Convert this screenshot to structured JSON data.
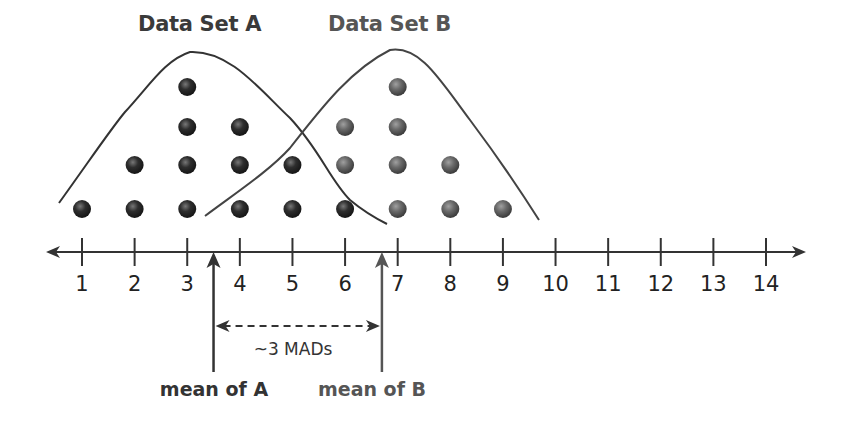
{
  "chart_data": {
    "type": "scatter",
    "subtype": "dot_plot",
    "titles": [
      "Data Set A",
      "Data Set B"
    ],
    "x_axis": {
      "min": 1,
      "max": 14,
      "ticks": [
        1,
        2,
        3,
        4,
        5,
        6,
        7,
        8,
        9,
        10,
        11,
        12,
        13,
        14
      ],
      "arrows_both_ends": true
    },
    "series": [
      {
        "name": "Data Set A",
        "color": "#2e2e2e",
        "counts": {
          "1": 1,
          "2": 2,
          "3": 4,
          "4": 3,
          "5": 2,
          "6": 1
        },
        "values": [
          1,
          2,
          2,
          3,
          3,
          3,
          3,
          4,
          4,
          4,
          5,
          5,
          6
        ],
        "mean_marker": 3.5
      },
      {
        "name": "Data Set B",
        "color": "#6a6a6a",
        "counts": {
          "6": 2,
          "7": 4,
          "8": 2,
          "9": 1
        },
        "values": [
          6,
          6,
          7,
          7,
          7,
          7,
          8,
          8,
          9
        ],
        "mean_marker": 6.7
      }
    ],
    "annotations": [
      {
        "text": "mean of A",
        "x": 3.5,
        "type": "arrow-up"
      },
      {
        "text": "mean of B",
        "x": 6.7,
        "type": "arrow-up"
      },
      {
        "text": "~3 MADs",
        "from": 3.5,
        "to": 6.7,
        "type": "dashed-double-arrow"
      }
    ],
    "curves": [
      "distribution outline of A",
      "distribution outline of B"
    ],
    "grid": false,
    "legend": "titles above each cluster"
  },
  "labels": {
    "title_a": "Data Set A",
    "title_b": "Data Set B",
    "mean_a": "mean of A",
    "mean_b": "mean of B",
    "mad": "~3 MADs"
  },
  "ticks": [
    "1",
    "2",
    "3",
    "4",
    "5",
    "6",
    "7",
    "8",
    "9",
    "10",
    "11",
    "12",
    "13",
    "14"
  ],
  "colors": {
    "dot_a": "#2e2e2e",
    "dot_b": "#6a6a6a",
    "line": "#333333"
  }
}
